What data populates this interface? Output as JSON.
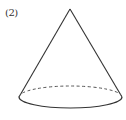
{
  "figure": {
    "label": "(2)",
    "shape": "cone",
    "stroke_color": "#333333",
    "apex": {
      "x": 70,
      "y": 9
    },
    "base": {
      "cx": 70.5,
      "cy": 97,
      "rx": 51.5,
      "ry": 11
    },
    "hidden_edge_style": "dashed"
  }
}
